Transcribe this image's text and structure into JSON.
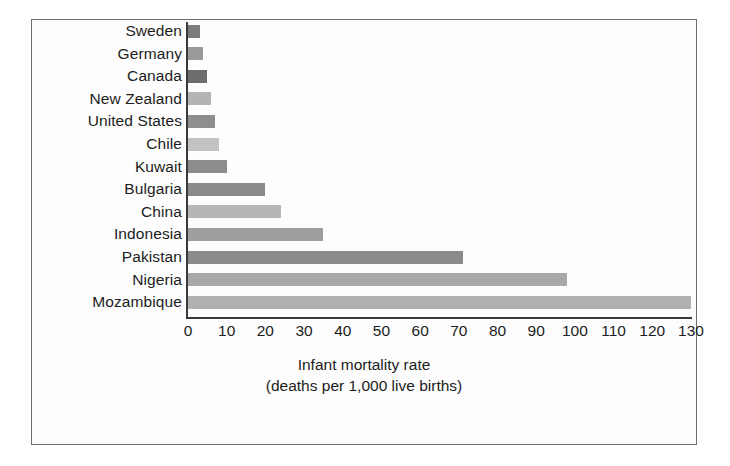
{
  "chart_data": {
    "type": "bar",
    "orientation": "horizontal",
    "title": "",
    "xlabel_lines": [
      "Infant mortality rate",
      "(deaths per 1,000 live births)"
    ],
    "ylabel": "",
    "xlim": [
      0,
      130
    ],
    "xticks": [
      0,
      10,
      20,
      30,
      40,
      50,
      60,
      70,
      80,
      90,
      100,
      110,
      120,
      130
    ],
    "xtick_labels": [
      "0",
      "10",
      "20",
      "30",
      "40",
      "50",
      "60",
      "70",
      "80",
      "90",
      "100",
      "110",
      "120",
      "130"
    ],
    "grid": false,
    "legend": "none",
    "categories": [
      "Sweden",
      "Germany",
      "Canada",
      "New Zealand",
      "United States",
      "Chile",
      "Kuwait",
      "Bulgaria",
      "China",
      "Indonesia",
      "Pakistan",
      "Nigeria",
      "Mozambique"
    ],
    "values": [
      3,
      4,
      5,
      6,
      7,
      8,
      10,
      20,
      24,
      35,
      71,
      98,
      130
    ],
    "bar_colors": [
      "#7c7c7c",
      "#9a9a9a",
      "#6d6d6d",
      "#b4b4b4",
      "#8e8e8e",
      "#c2c2c2",
      "#8c8c8c",
      "#8a8a8a",
      "#b6b6b6",
      "#9e9e9e",
      "#8b8b8b",
      "#a8a8a8",
      "#b0b0b0"
    ]
  },
  "axis": {
    "line_color": "#3a3a3a",
    "frame_color": "#6f6f6f"
  }
}
